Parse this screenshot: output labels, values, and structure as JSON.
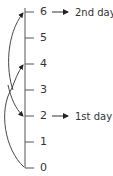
{
  "diagram": {
    "axis": {
      "ticks": [
        {
          "value": "6",
          "y": 12
        },
        {
          "value": "5",
          "y": 38
        },
        {
          "value": "4",
          "y": 64
        },
        {
          "value": "3",
          "y": 90
        },
        {
          "value": "2",
          "y": 116
        },
        {
          "value": "1",
          "y": 142
        },
        {
          "value": "0",
          "y": 168
        }
      ]
    },
    "annotations": [
      {
        "at": "6",
        "label": "2nd day"
      },
      {
        "at": "2",
        "label": "1st day"
      }
    ],
    "moves": [
      {
        "from": "0",
        "to": "4"
      },
      {
        "from": "4",
        "to": "2"
      },
      {
        "from": "2",
        "to": "6"
      }
    ],
    "colors": {
      "line": "#333333",
      "text": "#333333"
    }
  }
}
